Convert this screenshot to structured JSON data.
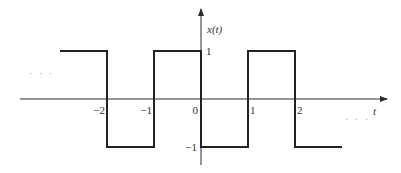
{
  "chart_data": {
    "type": "line",
    "subtype": "square-wave",
    "title": "",
    "ylabel": "x(t)",
    "xlabel": "t",
    "x_ticks": [
      -2,
      -1,
      0,
      1,
      2
    ],
    "x_tick_labels": [
      "−2",
      "−1",
      "0",
      "1",
      "2"
    ],
    "y_ticks": [
      1,
      -1
    ],
    "y_tick_labels": [
      "1",
      "−1"
    ],
    "xlim": [
      -3.0,
      3.0
    ],
    "ylim": [
      -1,
      1
    ],
    "series": [
      {
        "name": "x(t)",
        "points": [
          [
            -3.0,
            1
          ],
          [
            -2,
            1
          ],
          [
            -2,
            -1
          ],
          [
            -1,
            -1
          ],
          [
            -1,
            1
          ],
          [
            0,
            1
          ],
          [
            0,
            -1
          ],
          [
            1,
            -1
          ],
          [
            1,
            1
          ],
          [
            2,
            1
          ],
          [
            2,
            -1
          ],
          [
            3.0,
            -1
          ]
        ]
      }
    ],
    "annotations": {
      "left_continuation": "· · ·",
      "right_continuation": "· · ·"
    },
    "grid": false,
    "legend": "none"
  }
}
